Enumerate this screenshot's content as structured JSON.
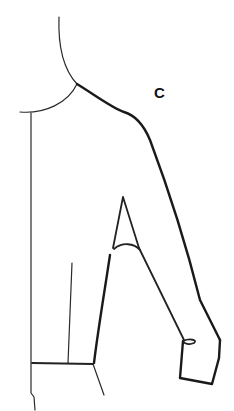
{
  "figure": {
    "label": "C",
    "colors": {
      "background": "#ffffff",
      "ink": "#1a1a1a"
    }
  },
  "paths": {
    "neck_back": "M59 17 C58 45 62 68 77 84",
    "front_neckline": "M20 112 C45 114 68 103 77 84",
    "shoulder_armhole": "M77 84 C95 95 112 108 124 112 C138 116 145 128 150 140 C165 180 185 240 200 300 L220 340",
    "center_front": "M31 113 L31 393 L34 397 L35 410",
    "side_seam_upper": "M110 255 C104 295 98 330 94 363",
    "dart_line": "M72 263 L68 363",
    "waistline": "M32 363 L93 364",
    "hip_line": "M93 364 L104 395",
    "underarm_triangle": "M123 197 L113 248 M123 197 L139 248",
    "elbow_curve": "M114 249 C122 242 134 243 140 250",
    "sleeve_inner": "M139 248 L184 340",
    "cuff_box": "M183 341 L180 378 L212 384 L219 358 L220 340",
    "cuff_button": "M183 341 C190 338 198 340 194 343 C190 345 184 344 183 341"
  }
}
